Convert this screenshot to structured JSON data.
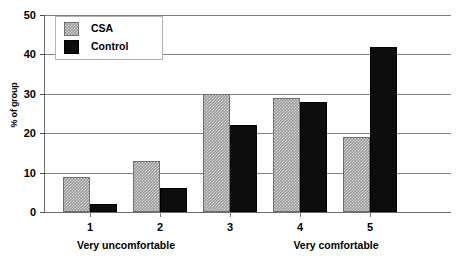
{
  "chart_data": {
    "type": "bar",
    "title": "",
    "xlabel": "",
    "ylabel": "% of group",
    "categories": [
      "1",
      "2",
      "3",
      "4",
      "5"
    ],
    "series": [
      {
        "name": "CSA",
        "values": [
          9,
          13,
          30,
          29,
          19
        ],
        "color": "#9a9a9a"
      },
      {
        "name": "Control",
        "values": [
          2,
          6,
          22,
          28,
          42
        ],
        "color": "#0d0d0d"
      }
    ],
    "ylim": [
      0,
      50
    ],
    "yticks": [
      0,
      10,
      20,
      30,
      40,
      50
    ],
    "ytick_labels": [
      "0",
      "10",
      "20",
      "30",
      "40",
      "50"
    ],
    "grid": true,
    "legend_position": "top-left",
    "annotations": [
      {
        "text": "Very uncomfortable",
        "near_category": "1"
      },
      {
        "text": "Very comfortable",
        "near_category": "5"
      }
    ]
  },
  "axis": {
    "y_title": "% of group",
    "y_ticks": [
      "0",
      "10",
      "20",
      "30",
      "40",
      "50"
    ],
    "x_ticks": [
      "1",
      "2",
      "3",
      "4",
      "5"
    ],
    "x_group_left": "Very uncomfortable",
    "x_group_right": "Very comfortable"
  },
  "legend": {
    "items": [
      {
        "label": "CSA",
        "swatch": "csa-swatch-icon"
      },
      {
        "label": "Control",
        "swatch": "control-swatch-icon"
      }
    ]
  }
}
